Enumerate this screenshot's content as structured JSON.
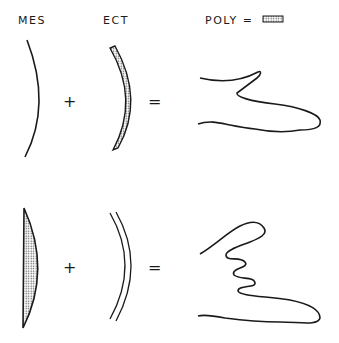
{
  "header": {
    "mes_label": "MES",
    "ect_label": "ECT",
    "poly_label": "POLY ="
  },
  "rows": [
    {
      "plus": "+",
      "equals": "=",
      "mes_fill": "none",
      "ect_style": "double-stippled",
      "result": "polyp-simple"
    },
    {
      "plus": "+",
      "equals": "=",
      "mes_fill": "stippled",
      "ect_style": "double-line",
      "result": "polyp-folded"
    }
  ],
  "colors": {
    "ink": "#1a1a1a",
    "background": "#ffffff"
  }
}
